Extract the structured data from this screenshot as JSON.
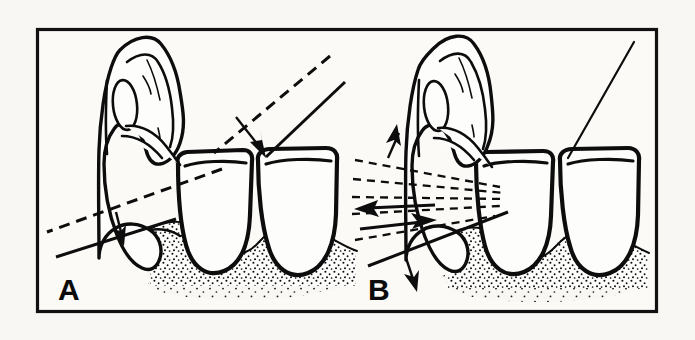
{
  "figure": {
    "background_color": "#f8f7f3",
    "ink_color": "#0d0d0d",
    "frame": {
      "name": "outer-border",
      "x": 36,
      "y": 28,
      "width": 622,
      "height": 285,
      "stroke_width": 3,
      "border_color": "#111111"
    },
    "panels": [
      {
        "id": "A",
        "label": "A",
        "label_x": 58,
        "label_y": 300,
        "caption": "Correct blade angulation approaching the tooth surface",
        "annotations": [
          {
            "name": "upper-dashed-approach-line",
            "kind": "dashed-line",
            "description": "Dashed line indicating the path of approach above the contact area",
            "x1": 330,
            "y1": 56,
            "x2": 212,
            "y2": 155
          },
          {
            "name": "upper-solid-blade-line",
            "kind": "solid-line",
            "description": "Solid line representing the instrument blade face at the tooth",
            "x1": 345,
            "y1": 82,
            "x2": 266,
            "y2": 156
          },
          {
            "name": "upper-arrow-down-right",
            "kind": "arrow",
            "direction": "down-right",
            "description": "Arrow showing direction of blade insertion toward the contact point",
            "tip_x": 265,
            "tip_y": 156
          },
          {
            "name": "lower-dashed-approach-line",
            "kind": "dashed-line",
            "description": "Dashed line showing the original blade position at the gingival margin",
            "x1": 220,
            "y1": 170,
            "x2": 47,
            "y2": 232
          },
          {
            "name": "lower-solid-blade-line",
            "kind": "solid-line",
            "description": "Solid line showing the adapted blade position",
            "x1": 170,
            "y1": 222,
            "x2": 56,
            "y2": 257
          },
          {
            "name": "lower-arrow-down",
            "kind": "arrow",
            "direction": "down",
            "description": "Arrow showing downward working stroke at the gingival margin",
            "tip_x": 122,
            "tip_y": 242
          }
        ]
      },
      {
        "id": "B",
        "label": "B",
        "label_x": 368,
        "label_y": 300,
        "caption": "Multidirectional strokes: vertical, oblique and horizontal",
        "annotations": [
          {
            "name": "pointer-line-to-contact",
            "kind": "solid-line",
            "description": "Thin pointer line indicating the interproximal contact area",
            "x1": 634,
            "y1": 42,
            "x2": 568,
            "y2": 157
          },
          {
            "name": "fan-dashed-line-1",
            "kind": "dashed-line",
            "description": "Uppermost dashed stroke line of the fan",
            "x1": 355,
            "y1": 161,
            "x2": 500,
            "y2": 186
          },
          {
            "name": "fan-dashed-line-2",
            "kind": "dashed-line",
            "description": "Second dashed stroke line of the fan",
            "x1": 353,
            "y1": 180,
            "x2": 505,
            "y2": 192
          },
          {
            "name": "fan-dashed-line-3",
            "kind": "dashed-line",
            "description": "Third dashed stroke line of the fan",
            "x1": 352,
            "y1": 198,
            "x2": 503,
            "y2": 198
          },
          {
            "name": "fan-dashed-line-4",
            "kind": "dashed-line",
            "description": "Fourth dashed stroke line of the fan",
            "x1": 352,
            "y1": 214,
            "x2": 500,
            "y2": 205
          },
          {
            "name": "fan-dashed-line-5",
            "kind": "dashed-line",
            "description": "Lowest dashed stroke line of the fan",
            "x1": 355,
            "y1": 240,
            "x2": 495,
            "y2": 215
          },
          {
            "name": "arrow-up",
            "kind": "arrow",
            "direction": "up",
            "description": "Arrow showing the vertical (upward) stroke direction",
            "tip_x": 398,
            "tip_y": 126
          },
          {
            "name": "arrow-left-horizontal",
            "kind": "arrow",
            "direction": "left",
            "description": "Arrow showing the horizontal stroke direction toward the left",
            "tip_x": 356,
            "tip_y": 208
          },
          {
            "name": "arrow-right-oblique",
            "kind": "arrow",
            "direction": "right",
            "description": "Arrow showing the oblique stroke direction toward the right",
            "tip_x": 434,
            "tip_y": 221
          },
          {
            "name": "solid-lower-stroke-line",
            "kind": "solid-line",
            "description": "Heavy solid line indicating the lower limit of stroke travel",
            "x1": 368,
            "y1": 265,
            "x2": 505,
            "y2": 213
          },
          {
            "name": "arrow-down",
            "kind": "arrow",
            "direction": "down",
            "description": "Arrow showing the vertical (downward) stroke direction",
            "tip_x": 415,
            "tip_y": 289
          }
        ]
      }
    ],
    "elements": {
      "instrument_name": "periodontal-curette-blade",
      "tooth_name": "posterior-tooth-crown",
      "gingiva_name": "stippled-gingival-tissue",
      "instrument_count_per_panel": 1,
      "tooth_count_per_panel": 2
    }
  }
}
